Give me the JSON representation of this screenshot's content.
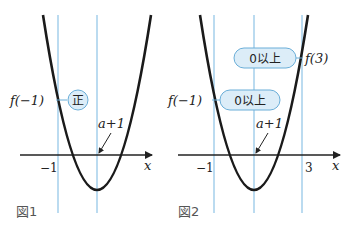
{
  "colors": {
    "curve": "#1a1a1a",
    "axis": "#222222",
    "guide_line": "#8ec3e6",
    "callout_fill": "#dcedf8",
    "callout_stroke": "#6aaed8",
    "text": "#222222",
    "figure_label": "#555555"
  },
  "figure1": {
    "label": "図1",
    "x_axis_label": "x",
    "tick_minus1": "−1",
    "f_label": "f(−1)",
    "callout": "正",
    "vertex_label": "a+1"
  },
  "figure2": {
    "label": "図2",
    "x_axis_label": "x",
    "tick_minus1": "−1",
    "tick_3": "3",
    "f_minus1_label": "f(−1)",
    "f_minus1_callout": "0以上",
    "f3_label": "f(3)",
    "f3_callout": "0以上",
    "vertex_label": "a+1"
  }
}
